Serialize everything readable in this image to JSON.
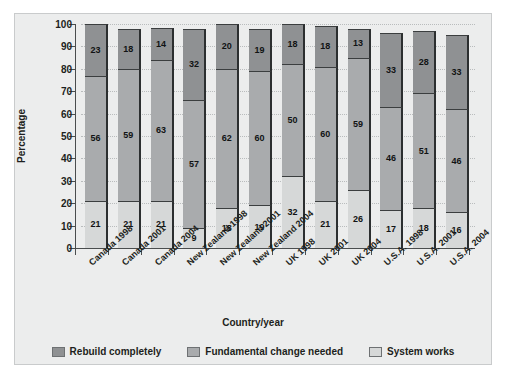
{
  "chart_data": {
    "type": "bar",
    "subtype": "stacked-bar-percent",
    "title": "",
    "xlabel": "Country/year",
    "ylabel": "Percentage",
    "ylim": [
      0,
      100
    ],
    "yticks": [
      0,
      10,
      20,
      30,
      40,
      50,
      60,
      70,
      80,
      90,
      100
    ],
    "grid": true,
    "legend_position": "bottom",
    "categories": [
      "Canada 1998",
      "Canada 2001",
      "Canada 2004",
      "New Zealand 1998",
      "New Zealand 2001",
      "New Zealand 2004",
      "UK 1998",
      "UK 2001",
      "UK 2004",
      "U.S.A. 1998",
      "U.S.A. 2001",
      "U.S.A. 2004"
    ],
    "series": [
      {
        "name": "Rebuild completely",
        "color": "#8f9193",
        "stack_position": "top",
        "values": [
          23,
          18,
          14,
          32,
          20,
          19,
          18,
          18,
          13,
          33,
          28,
          33
        ]
      },
      {
        "name": "Fundamental change needed",
        "color": "#a9abad",
        "stack_position": "middle",
        "values": [
          56,
          59,
          63,
          57,
          62,
          60,
          50,
          60,
          59,
          46,
          51,
          46
        ]
      },
      {
        "name": "System works",
        "color": "#d6d8d8",
        "stack_position": "bottom",
        "values": [
          21,
          21,
          21,
          9,
          18,
          19,
          32,
          21,
          26,
          17,
          18,
          16
        ]
      }
    ]
  }
}
